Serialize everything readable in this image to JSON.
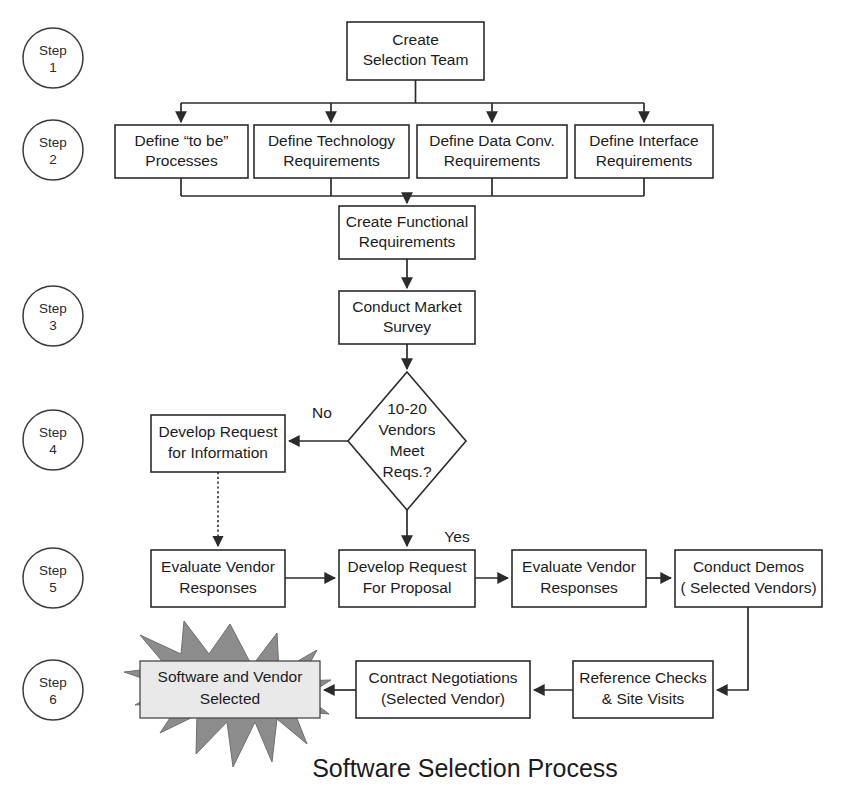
{
  "diagram": {
    "title": "Software Selection Process",
    "type": "flowchart",
    "colors": {
      "background": "#ffffff",
      "node_fill": "#ffffff",
      "node_stroke": "#2b2b2b",
      "burst_fill": "#8c8c8c",
      "burst_box_fill": "#e9e9e9",
      "text": "#1c1c1c"
    }
  },
  "steps": [
    {
      "id": "step1",
      "line1": "Step",
      "line2": "1",
      "cx": 53,
      "cy": 58
    },
    {
      "id": "step2",
      "line1": "Step",
      "line2": "2",
      "cx": 53,
      "cy": 150
    },
    {
      "id": "step3",
      "line1": "Step",
      "line2": "3",
      "cx": 53,
      "cy": 316
    },
    {
      "id": "step4",
      "line1": "Step",
      "line2": "4",
      "cx": 53,
      "cy": 440
    },
    {
      "id": "step5",
      "line1": "Step",
      "line2": "5",
      "cx": 53,
      "cy": 578
    },
    {
      "id": "step6",
      "line1": "Step",
      "line2": "6",
      "cx": 53,
      "cy": 690
    }
  ],
  "nodes": [
    {
      "id": "create-selection-team",
      "shape": "rect",
      "lines": [
        "Create",
        "Selection Team"
      ],
      "x": 347,
      "y": 22,
      "w": 137,
      "h": 58
    },
    {
      "id": "define-to-be-processes",
      "shape": "rect",
      "lines": [
        "Define “to be”",
        "Processes"
      ],
      "x": 115,
      "y": 125,
      "w": 133,
      "h": 53
    },
    {
      "id": "define-technology-requirements",
      "shape": "rect",
      "lines": [
        "Define Technology",
        "Requirements"
      ],
      "x": 254,
      "y": 125,
      "w": 155,
      "h": 53
    },
    {
      "id": "define-data-conv-requirements",
      "shape": "rect",
      "lines": [
        "Define Data Conv.",
        "Requirements"
      ],
      "x": 417,
      "y": 125,
      "w": 150,
      "h": 53
    },
    {
      "id": "define-interface-requirements",
      "shape": "rect",
      "lines": [
        "Define Interface",
        "Requirements"
      ],
      "x": 575,
      "y": 125,
      "w": 138,
      "h": 53
    },
    {
      "id": "create-functional-requirements",
      "shape": "rect",
      "lines": [
        "Create Functional",
        "Requirements"
      ],
      "x": 339,
      "y": 206,
      "w": 136,
      "h": 53
    },
    {
      "id": "conduct-market-survey",
      "shape": "rect",
      "lines": [
        "Conduct Market",
        "Survey"
      ],
      "x": 339,
      "y": 291,
      "w": 136,
      "h": 53
    },
    {
      "id": "vendors-meet-reqs-decision",
      "shape": "diamond",
      "lines": [
        "10-20",
        "Vendors",
        "Meet",
        "Reqs.?"
      ],
      "cx": 407,
      "cy": 441,
      "rx": 59,
      "ry": 69
    },
    {
      "id": "develop-request-for-information",
      "shape": "rect",
      "lines": [
        "Develop Request",
        "for Information"
      ],
      "x": 151,
      "y": 415,
      "w": 134,
      "h": 57
    },
    {
      "id": "evaluate-vendor-responses-1",
      "shape": "rect",
      "lines": [
        "Evaluate Vendor",
        "Responses"
      ],
      "x": 151,
      "y": 550,
      "w": 134,
      "h": 57
    },
    {
      "id": "develop-request-for-proposal",
      "shape": "rect",
      "lines": [
        "Develop Request",
        "For Proposal"
      ],
      "x": 339,
      "y": 550,
      "w": 136,
      "h": 57
    },
    {
      "id": "evaluate-vendor-responses-2",
      "shape": "rect",
      "lines": [
        "Evaluate Vendor",
        "Responses"
      ],
      "x": 512,
      "y": 550,
      "w": 134,
      "h": 57
    },
    {
      "id": "conduct-demos",
      "shape": "rect",
      "lines": [
        "Conduct Demos",
        "( Selected Vendors)"
      ],
      "x": 675,
      "y": 550,
      "w": 147,
      "h": 57
    },
    {
      "id": "reference-checks-site-visits",
      "shape": "rect",
      "lines": [
        "Reference Checks",
        "& Site Visits"
      ],
      "x": 573,
      "y": 661,
      "w": 140,
      "h": 57
    },
    {
      "id": "contract-negotiations",
      "shape": "rect",
      "lines": [
        "Contract Negotiations",
        "(Selected Vendor)"
      ],
      "x": 356,
      "y": 661,
      "w": 174,
      "h": 57
    },
    {
      "id": "software-and-vendor-selected",
      "shape": "burst",
      "lines": [
        "Software and Vendor",
        "Selected"
      ],
      "x": 140,
      "y": 661,
      "w": 180,
      "h": 57
    }
  ],
  "edge_labels": [
    {
      "id": "no-label",
      "text": "No",
      "x": 322,
      "y": 413
    },
    {
      "id": "yes-label",
      "text": "Yes",
      "x": 452,
      "y": 537
    }
  ]
}
